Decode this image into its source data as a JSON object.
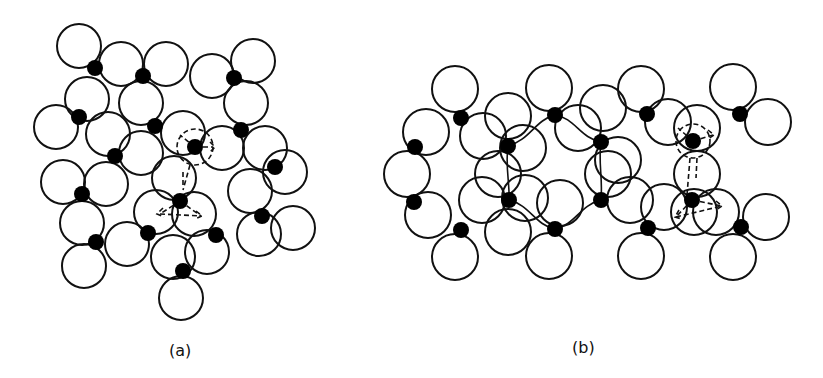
{
  "figure": {
    "panels": [
      {
        "id": "a",
        "label": "(a)",
        "description": "Random close-packed arrangement of oxygen spheres (open circles) with silicon atoms (filled dots) in a continuous random network",
        "circle_radius": 22,
        "circles": [
          [
            79,
            46
          ],
          [
            121,
            64
          ],
          [
            166,
            64
          ],
          [
            212,
            76
          ],
          [
            253,
            61
          ],
          [
            87,
            99
          ],
          [
            141,
            103
          ],
          [
            246,
            103
          ],
          [
            56,
            127
          ],
          [
            108,
            134
          ],
          [
            183,
            133
          ],
          [
            141,
            153
          ],
          [
            222,
            148
          ],
          [
            265,
            148
          ],
          [
            285,
            172
          ],
          [
            63,
            182
          ],
          [
            106,
            184
          ],
          [
            174,
            178
          ],
          [
            250,
            191
          ],
          [
            82,
            223
          ],
          [
            156,
            212
          ],
          [
            194,
            214
          ],
          [
            293,
            228
          ],
          [
            259,
            234
          ],
          [
            84,
            266
          ],
          [
            127,
            244
          ],
          [
            173,
            257
          ],
          [
            207,
            252
          ],
          [
            181,
            298
          ]
        ],
        "dots": [
          [
            95,
            68
          ],
          [
            143,
            76
          ],
          [
            234,
            78
          ],
          [
            79,
            117
          ],
          [
            155,
            126
          ],
          [
            241,
            130
          ],
          [
            115,
            156
          ],
          [
            195,
            147
          ],
          [
            275,
            167
          ],
          [
            82,
            194
          ],
          [
            180,
            201
          ],
          [
            262,
            216
          ],
          [
            96,
            242
          ],
          [
            148,
            233
          ],
          [
            216,
            235
          ],
          [
            183,
            271
          ]
        ],
        "dashed_marker_dots": [
          [
            195,
            147
          ],
          [
            180,
            201
          ]
        ]
      },
      {
        "id": "b",
        "label": "(b)",
        "description": "Ordered (crystalline-like) arrangement of the same spheres with silicon atoms in a periodic ring network",
        "circle_radius": 23,
        "circles": [
          [
            455,
            89
          ],
          [
            426,
            132
          ],
          [
            483,
            136
          ],
          [
            407,
            174
          ],
          [
            428,
            215
          ],
          [
            482,
            200
          ],
          [
            455,
            257
          ],
          [
            549,
            88
          ],
          [
            508,
            116
          ],
          [
            578,
            128
          ],
          [
            523,
            148
          ],
          [
            498,
            174
          ],
          [
            525,
            198
          ],
          [
            560,
            203
          ],
          [
            508,
            232
          ],
          [
            549,
            256
          ],
          [
            641,
            89
          ],
          [
            603,
            108
          ],
          [
            668,
            122
          ],
          [
            618,
            160
          ],
          [
            608,
            174
          ],
          [
            630,
            200
          ],
          [
            664,
            207
          ],
          [
            641,
            256
          ],
          [
            733,
            87
          ],
          [
            697,
            128
          ],
          [
            768,
            122
          ],
          [
            697,
            174
          ],
          [
            694,
            212
          ],
          [
            716,
            212
          ],
          [
            766,
            217
          ],
          [
            733,
            257
          ]
        ],
        "dots": [
          [
            461,
            118
          ],
          [
            415,
            147
          ],
          [
            508,
            146
          ],
          [
            555,
            115
          ],
          [
            601,
            142
          ],
          [
            647,
            114
          ],
          [
            693,
            141
          ],
          [
            740,
            114
          ],
          [
            414,
            202
          ],
          [
            509,
            200
          ],
          [
            461,
            230
          ],
          [
            555,
            229
          ],
          [
            601,
            200
          ],
          [
            648,
            228
          ],
          [
            692,
            200
          ],
          [
            741,
            227
          ]
        ],
        "dashed_marker_dots": [
          [
            693,
            141
          ],
          [
            692,
            200
          ]
        ]
      }
    ]
  }
}
